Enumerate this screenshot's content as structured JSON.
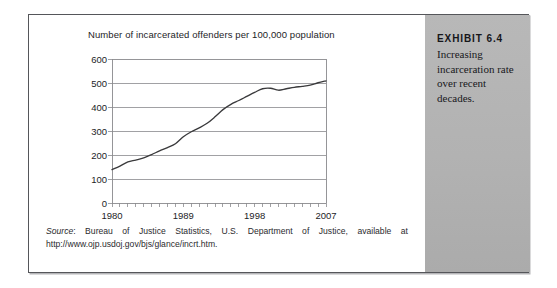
{
  "chart_data": {
    "type": "line",
    "title": "Number of incarcerated offenders per 100,000 population",
    "xlabel": "",
    "ylabel": "",
    "ylim": [
      0,
      600
    ],
    "xlim": [
      1980,
      2007
    ],
    "ytick_labels": [
      "600",
      "500",
      "400",
      "300",
      "200",
      "100",
      "0"
    ],
    "yticks": [
      600,
      500,
      400,
      300,
      200,
      100,
      0
    ],
    "xtick_labels": [
      "1980",
      "1989",
      "1998",
      "2007"
    ],
    "xticks": [
      1980,
      1989,
      1998,
      2007
    ],
    "grid": "horizontal",
    "legend": "none",
    "series": [
      {
        "name": "Incarceration rate per 100,000 population",
        "x": [
          1980,
          1981,
          1982,
          1983,
          1984,
          1985,
          1986,
          1987,
          1988,
          1989,
          1990,
          1991,
          1992,
          1993,
          1994,
          1995,
          1996,
          1997,
          1998,
          1999,
          2000,
          2001,
          2002,
          2003,
          2004,
          2005,
          2006,
          2007
        ],
        "values": [
          139,
          154,
          171,
          179,
          188,
          202,
          217,
          231,
          247,
          276,
          297,
          313,
          332,
          359,
          389,
          411,
          427,
          444,
          461,
          476,
          478,
          470,
          476,
          482,
          486,
          491,
          501,
          509
        ]
      }
    ]
  },
  "source_note": {
    "label": "Source",
    "text": ": Bureau of Justice Statistics, U.S. Department of Justice, available at http://www.ojp.usdoj.gov/bjs/glance/incrt.htm."
  },
  "caption": {
    "heading": "EXHIBIT 6.4",
    "body": "Increasing incarceration rate over recent decades."
  },
  "colors": {
    "frame_border": "#55565a",
    "plot_line": "#3a3a3c",
    "gridline": "#8a8a8d",
    "panel_bg": "#b3b3b3",
    "text": "#1d1d1f"
  }
}
